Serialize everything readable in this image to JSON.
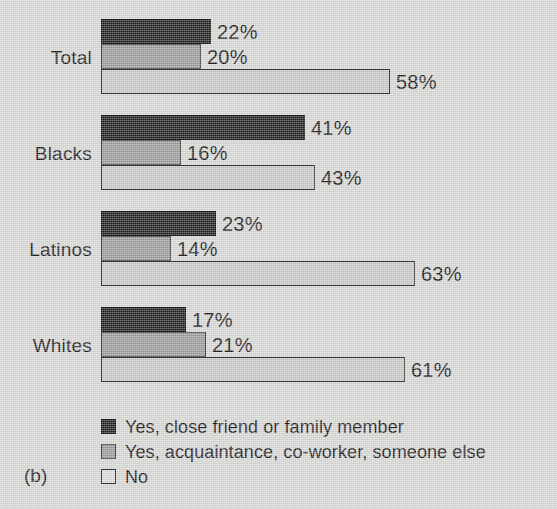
{
  "chart_data": {
    "type": "bar",
    "orientation": "horizontal",
    "title": "",
    "subtitle": "",
    "xlabel": "",
    "ylabel": "",
    "panel_label": "(b)",
    "grid": false,
    "legend_position": "bottom-left",
    "xlim": [
      0,
      63
    ],
    "value_suffix": "%",
    "categories": [
      "Total",
      "Blacks",
      "Latinos",
      "Whites"
    ],
    "series": [
      {
        "name": "Yes, close friend or family member",
        "color": "#1d1d1d",
        "values": [
          22,
          41,
          23,
          17
        ],
        "labels": [
          "22%",
          "41%",
          "23%",
          "17%"
        ]
      },
      {
        "name": "Yes, acquaintance, co-worker, someone else",
        "color": "#9a9a9a",
        "values": [
          20,
          16,
          14,
          21
        ],
        "labels": [
          "20%",
          "16%",
          "14%",
          "21%"
        ]
      },
      {
        "name": "No",
        "color": "#c9c9c9",
        "values": [
          58,
          43,
          63,
          61
        ],
        "labels": [
          "58%",
          "43%",
          "63%",
          "61%"
        ]
      }
    ]
  },
  "legend": {
    "items": [
      {
        "label": "Yes, close friend or family member",
        "swatch": "legend-swatch-black"
      },
      {
        "label": "Yes, acquaintance, co-worker, someone else",
        "swatch": "legend-swatch-gray"
      },
      {
        "label": "No",
        "swatch": "legend-swatch-white"
      }
    ]
  },
  "panel": {
    "tag": "(b)"
  },
  "colors": {
    "series_close_friend": "#1d1d1d",
    "series_acquaintance": "#9a9a9a",
    "series_no": "#c9c9c9",
    "background": "#d8d8d6",
    "text": "#141414"
  }
}
